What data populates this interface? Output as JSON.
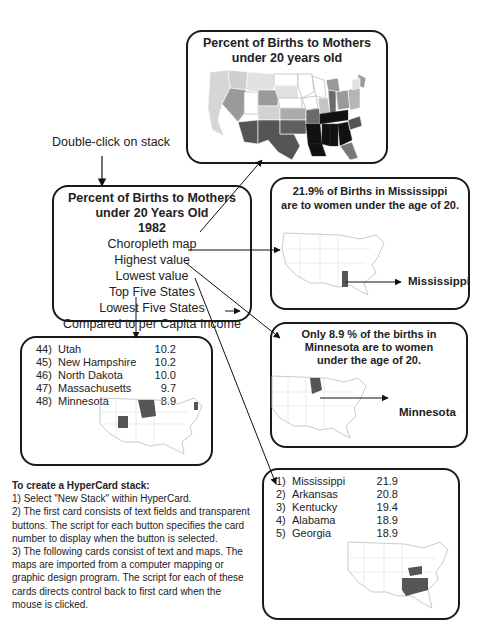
{
  "diagram": {
    "instruction": "Double-click on stack",
    "top_card": {
      "title_line1": "Percent of Births to Mothers",
      "title_line2": "under 20 years old",
      "map": "choropleth-us-map"
    },
    "main_card": {
      "title_line1": "Percent of Births to Mothers",
      "title_line2": "under 20 Years Old",
      "year": "1982",
      "options": [
        {
          "label": "Choropleth map"
        },
        {
          "label": "Highest value"
        },
        {
          "label": "Lowest value"
        },
        {
          "label": "Top Five States"
        },
        {
          "label": "Lowest Five States"
        },
        {
          "label": "Compared to per Capita Income"
        }
      ]
    },
    "highest_card": {
      "line1": "21.9% of Births in Mississippi",
      "line2": "are to women under the age of 20.",
      "callout": "Mississippi"
    },
    "lowest_card": {
      "line1": "Only 8.9 % of the births in",
      "line2": "Minnesota are to women",
      "line3": "under the age of 20.",
      "callout": "Minnesota"
    },
    "lowest_five_card": {
      "rows": [
        {
          "rank": "44)",
          "state": "Utah",
          "value": "10.2"
        },
        {
          "rank": "45)",
          "state": "New Hampshire",
          "value": "10.2"
        },
        {
          "rank": "46)",
          "state": "North Dakota",
          "value": "10.0"
        },
        {
          "rank": "47)",
          "state": "Massachusetts",
          "value": "9.7"
        },
        {
          "rank": "48)",
          "state": "Minnesota",
          "value": "8.9"
        }
      ]
    },
    "top_five_card": {
      "rows": [
        {
          "rank": "1)",
          "state": "Mississippi",
          "value": "21.9"
        },
        {
          "rank": "2)",
          "state": "Arkansas",
          "value": "20.8"
        },
        {
          "rank": "3)",
          "state": "Kentucky",
          "value": "19.4"
        },
        {
          "rank": "4)",
          "state": "Alabama",
          "value": "18.9"
        },
        {
          "rank": "5)",
          "state": "Georgia",
          "value": "18.9"
        }
      ]
    },
    "notes": {
      "heading": "To create a HyperCard stack:",
      "step1": "1)  Select \"New Stack\" within HyperCard.",
      "step2": "2)  The first card consists of text fields and transparent buttons.  The script for each button specifies the card number to display when the button is selected.",
      "step3": "3)  The following cards consist of text and maps. The maps are imported from a computer mapping or graphic design program.  The script for each of these cards directs control back to first card when the mouse is clicked."
    }
  },
  "colors": {
    "darkest": "#111111",
    "dark": "#555555",
    "mid": "#8a8a8a",
    "light": "#bdbdbd",
    "lightest": "#e6e6e6",
    "outline": "#1a1a1a"
  }
}
